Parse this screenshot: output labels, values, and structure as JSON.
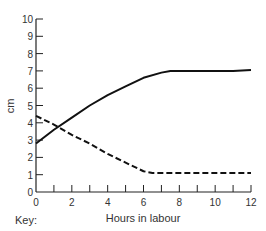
{
  "chart_data": {
    "type": "line",
    "title": "",
    "xlabel": "Hours in labour",
    "ylabel": "cm",
    "xlim": [
      0,
      12
    ],
    "ylim": [
      0,
      10
    ],
    "x_ticks": [
      0,
      2,
      4,
      6,
      8,
      10,
      12
    ],
    "x_minor_ticks": [
      1,
      3,
      5,
      7,
      9,
      11
    ],
    "y_ticks": [
      0,
      1,
      2,
      3,
      4,
      5,
      6,
      7,
      8,
      9,
      10
    ],
    "grid": false,
    "legend_label": "Key:",
    "series": [
      {
        "name": "solid line",
        "style": "solid",
        "x": [
          0,
          1,
          2,
          3,
          4,
          5,
          6,
          7,
          7.5,
          8,
          9,
          10,
          11,
          12
        ],
        "y": [
          2.8,
          3.6,
          4.3,
          5.0,
          5.6,
          6.1,
          6.6,
          6.9,
          7.0,
          7.0,
          7.0,
          7.0,
          7.0,
          7.05
        ]
      },
      {
        "name": "dashed line",
        "style": "dashed",
        "x": [
          0,
          1,
          2,
          3,
          4,
          5,
          6,
          6.5,
          7,
          8,
          9,
          10,
          11,
          12
        ],
        "y": [
          4.4,
          3.9,
          3.3,
          2.8,
          2.2,
          1.7,
          1.2,
          1.1,
          1.1,
          1.1,
          1.1,
          1.1,
          1.1,
          1.1
        ]
      }
    ]
  },
  "key": {
    "label": "Key:"
  }
}
